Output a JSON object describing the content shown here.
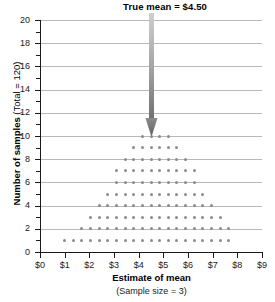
{
  "chart_data": {
    "type": "scatter",
    "title": "True mean  =  $4.50",
    "xlabel": "Estimate of mean",
    "xlabel_sub": "(Sample size = 3)",
    "ylabel_bold": "Number of samples",
    "ylabel_reg": " (Total = 120)",
    "xlim": [
      0,
      9
    ],
    "ylim": [
      0,
      20
    ],
    "xticks": [
      "$0",
      "$1",
      "$2",
      "$3",
      "$4",
      "$5",
      "$6",
      "$7",
      "$8",
      "$9"
    ],
    "xtick_values": [
      0,
      1,
      2,
      3,
      4,
      5,
      6,
      7,
      8,
      9
    ],
    "yticks": [
      "0",
      "2",
      "4",
      "6",
      "8",
      "10",
      "12",
      "14",
      "16",
      "18",
      "20"
    ],
    "ytick_values": [
      0,
      2,
      4,
      6,
      8,
      10,
      12,
      14,
      16,
      18,
      20
    ],
    "yminor_values": [
      1,
      3,
      5,
      7,
      9,
      11,
      13,
      15,
      17,
      19
    ],
    "gridlines_y": [
      2,
      4,
      6,
      8,
      10,
      12,
      14,
      16,
      18,
      20
    ],
    "grid": true,
    "legend": "none",
    "dot_color": "#8b8b8b",
    "grid_color": "#b9b9b9",
    "axis_color": "#1a1a1a",
    "arrow_color_top": "#c8c8c8",
    "arrow_color_bottom": "#6e6e6e",
    "annotation": {
      "text": "True mean  =  $4.50",
      "x_value": 4.5,
      "arrow": "down-arrow"
    },
    "total_samples": 120,
    "dot_spacing_x": 0.35,
    "rows": [
      {
        "y": 1,
        "count": 20,
        "x_start": 1.0
      },
      {
        "y": 2,
        "count": 18,
        "x_start": 1.7
      },
      {
        "y": 3,
        "count": 16,
        "x_start": 2.05
      },
      {
        "y": 4,
        "count": 14,
        "x_start": 2.4
      },
      {
        "y": 5,
        "count": 12,
        "x_start": 2.75
      },
      {
        "y": 6,
        "count": 10,
        "x_start": 3.1
      },
      {
        "y": 7,
        "count": 10,
        "x_start": 3.1
      },
      {
        "y": 8,
        "count": 8,
        "x_start": 3.45
      },
      {
        "y": 9,
        "count": 6,
        "x_start": 3.8
      },
      {
        "y": 10,
        "count": 4,
        "x_start": 4.15
      }
    ]
  }
}
